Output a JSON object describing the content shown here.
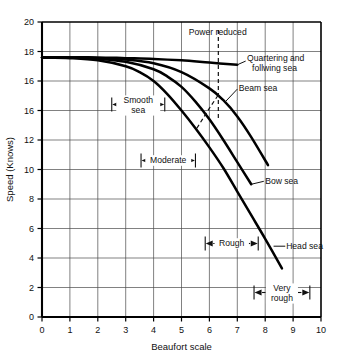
{
  "chart_data": {
    "type": "line",
    "title": "",
    "xlabel": "Beaufort scale",
    "ylabel": "Speed (Knows)",
    "xlim": [
      0,
      10
    ],
    "ylim": [
      0,
      20
    ],
    "grid": true,
    "legend_position": "inline-right-labels",
    "xticks": [
      "0",
      "1",
      "2",
      "3",
      "4",
      "5",
      "6",
      "7",
      "8",
      "9",
      "10"
    ],
    "yticks": [
      "0",
      "2",
      "4",
      "6",
      "8",
      "10",
      "12",
      "16",
      "16",
      "18",
      "20"
    ],
    "ytick_values": [
      0,
      2,
      4,
      6,
      8,
      10,
      12,
      14,
      16,
      18,
      20
    ],
    "series": [
      {
        "name": "Quartering and follwing sea",
        "x": [
          0,
          1,
          2,
          3,
          4,
          5,
          6,
          7
        ],
        "values": [
          17.6,
          17.6,
          17.6,
          17.55,
          17.5,
          17.4,
          17.25,
          17.1
        ]
      },
      {
        "name": "Beam sea",
        "x": [
          0,
          1,
          2,
          3,
          4,
          5,
          6,
          6.5,
          7,
          7.5,
          8.1
        ],
        "values": [
          17.6,
          17.6,
          17.55,
          17.45,
          17.2,
          16.6,
          15.5,
          14.7,
          13.6,
          12.2,
          10.3
        ]
      },
      {
        "name": "Bow sea",
        "x": [
          0,
          1,
          2,
          3,
          4,
          4.5,
          5,
          5.5,
          6,
          6.5,
          7,
          7.5
        ],
        "values": [
          17.6,
          17.6,
          17.5,
          17.3,
          16.8,
          16.3,
          15.6,
          14.6,
          13.4,
          12.0,
          10.5,
          9.0
        ]
      },
      {
        "name": "Head sea",
        "x": [
          0,
          1,
          2,
          3,
          3.5,
          4,
          4.5,
          5,
          5.5,
          6,
          6.5,
          7,
          7.5,
          8,
          8.6
        ],
        "values": [
          17.6,
          17.55,
          17.4,
          17.0,
          16.6,
          16.0,
          15.1,
          14.0,
          12.8,
          11.5,
          10.1,
          8.5,
          6.9,
          5.3,
          3.3
        ]
      }
    ],
    "annotations": [
      {
        "name": "power-reduced",
        "text": "Power reduced",
        "x": 6.3,
        "y": 19.3
      },
      {
        "name": "quartering-following-sea",
        "text_line_1": "Quartering and",
        "text_line_2": "follwing sea",
        "x": 7.35,
        "y": 17.4
      },
      {
        "name": "beam-sea",
        "text": "Beam sea",
        "x": 7.05,
        "y": 15.5
      },
      {
        "name": "bow-sea",
        "text": "Bow sea",
        "x": 8.0,
        "y": 9.2
      },
      {
        "name": "head-sea",
        "text": "Head sea",
        "x": 8.75,
        "y": 4.8
      },
      {
        "name": "smooth-sea",
        "text_line_1": "Smooth",
        "text_line_2": "sea",
        "span_from": 2.5,
        "span_to": 4.4
      },
      {
        "name": "moderate",
        "text": "Moderate",
        "span_from": 3.55,
        "span_to": 5.5
      },
      {
        "name": "rough",
        "text": "Rough",
        "span_from": 5.85,
        "span_to": 7.75
      },
      {
        "name": "very-rough",
        "text_line_1": "Very",
        "text_line_2": "rough",
        "span_from": 7.6,
        "span_to": 9.6
      }
    ],
    "colors": {
      "curve": "#000000",
      "grid": "#4a4a4a",
      "frame": "#000000",
      "text": "#111111",
      "background": "#ffffff"
    }
  }
}
